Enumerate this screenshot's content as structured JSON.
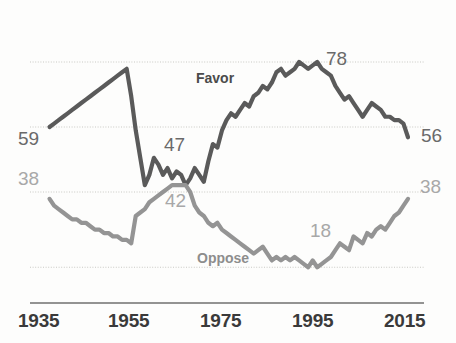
{
  "chart_data": {
    "type": "line",
    "title": "",
    "subtitle": "",
    "xlabel": "",
    "ylabel": "",
    "xlim": [
      1935,
      2015
    ],
    "ylim": [
      0,
      100
    ],
    "grid": true,
    "gridlines_y": [
      18,
      40,
      59,
      78,
      100
    ],
    "legend_position": "inline-annotation",
    "x_tick_labels": [
      "1935",
      "1955",
      "1975",
      "1995",
      "2015"
    ],
    "x_ticks": [
      1935,
      1955,
      1975,
      1995,
      2015
    ],
    "series": [
      {
        "name": "Favor",
        "color": "#5a5a5a",
        "x": [
          1936,
          1937,
          1938,
          1939,
          1940,
          1941,
          1942,
          1943,
          1944,
          1945,
          1946,
          1947,
          1948,
          1949,
          1950,
          1951,
          1952,
          1953,
          1954,
          1955,
          1956,
          1957,
          1958,
          1959,
          1960,
          1961,
          1962,
          1963,
          1964,
          1965,
          1966,
          1967,
          1968,
          1969,
          1970,
          1971,
          1972,
          1973,
          1974,
          1975,
          1976,
          1977,
          1978,
          1979,
          1980,
          1981,
          1982,
          1983,
          1984,
          1985,
          1986,
          1987,
          1988,
          1989,
          1990,
          1991,
          1992,
          1993,
          1994,
          1995,
          1996,
          1997,
          1998,
          1999,
          2000,
          2001,
          2002,
          2003,
          2004,
          2005,
          2006,
          2007,
          2008,
          2009,
          2010,
          2011,
          2012,
          2013,
          2014,
          2015
        ],
        "values": [
          59,
          60,
          61,
          62,
          63,
          64,
          65,
          66,
          67,
          68,
          69,
          70,
          71,
          72,
          73,
          74,
          75,
          76,
          68,
          58,
          50,
          42,
          45,
          50,
          48,
          45,
          47,
          44,
          46,
          45,
          42,
          44,
          47,
          45,
          43,
          49,
          54,
          53,
          58,
          61,
          63,
          62,
          64,
          66,
          65,
          68,
          69,
          71,
          70,
          72,
          75,
          76,
          74,
          75,
          76,
          78,
          77,
          76,
          77,
          78,
          76,
          75,
          74,
          71,
          69,
          67,
          68,
          66,
          64,
          62,
          64,
          66,
          65,
          64,
          62,
          62,
          61,
          61,
          60,
          56
        ]
      },
      {
        "name": "Oppose",
        "color": "#949494",
        "x": [
          1936,
          1937,
          1938,
          1939,
          1940,
          1941,
          1942,
          1943,
          1944,
          1945,
          1946,
          1947,
          1948,
          1949,
          1950,
          1951,
          1952,
          1953,
          1954,
          1955,
          1956,
          1957,
          1958,
          1959,
          1960,
          1961,
          1962,
          1963,
          1964,
          1965,
          1966,
          1967,
          1968,
          1969,
          1970,
          1971,
          1972,
          1973,
          1974,
          1975,
          1976,
          1977,
          1978,
          1979,
          1980,
          1981,
          1982,
          1983,
          1984,
          1985,
          1986,
          1987,
          1988,
          1989,
          1990,
          1991,
          1992,
          1993,
          1994,
          1995,
          1996,
          1997,
          1998,
          1999,
          2000,
          2001,
          2002,
          2003,
          2004,
          2005,
          2006,
          2007,
          2008,
          2009,
          2010,
          2011,
          2012,
          2013,
          2014,
          2015
        ],
        "values": [
          38,
          36,
          35,
          34,
          33,
          32,
          32,
          31,
          31,
          30,
          29,
          29,
          28,
          28,
          27,
          27,
          26,
          26,
          25,
          33,
          34,
          35,
          37,
          38,
          39,
          40,
          41,
          42,
          42,
          42,
          42,
          40,
          36,
          34,
          33,
          31,
          30,
          31,
          29,
          28,
          27,
          26,
          25,
          24,
          23,
          22,
          23,
          24,
          22,
          20,
          21,
          20,
          21,
          20,
          21,
          20,
          19,
          18,
          20,
          18,
          19,
          20,
          21,
          23,
          25,
          24,
          23,
          27,
          26,
          25,
          28,
          27,
          29,
          30,
          29,
          31,
          33,
          34,
          36,
          38
        ]
      }
    ],
    "point_annotations": [
      {
        "label": "59",
        "series": "Favor",
        "value": 59,
        "year": 1936,
        "tone": "dark"
      },
      {
        "label": "47",
        "series": "Favor",
        "value": 47,
        "year": 1968,
        "tone": "dark"
      },
      {
        "label": "78",
        "series": "Favor",
        "value": 78,
        "year": 1991,
        "tone": "dark"
      },
      {
        "label": "56",
        "series": "Favor",
        "value": 56,
        "year": 2015,
        "tone": "dark"
      },
      {
        "label": "38",
        "series": "Oppose",
        "value": 38,
        "year": 1936,
        "tone": "light"
      },
      {
        "label": "42",
        "series": "Oppose",
        "value": 42,
        "year": 1963,
        "tone": "light"
      },
      {
        "label": "18",
        "series": "Oppose",
        "value": 18,
        "year": 1995,
        "tone": "light"
      },
      {
        "label": "38",
        "series": "Oppose",
        "value": 38,
        "year": 2015,
        "tone": "light"
      }
    ]
  },
  "axis": {
    "ticks": [
      {
        "label": "1935"
      },
      {
        "label": "1955"
      },
      {
        "label": "1975"
      },
      {
        "label": "1995"
      },
      {
        "label": "2015"
      }
    ]
  },
  "series_labels": {
    "favor": "Favor",
    "oppose": "Oppose"
  },
  "annotations": {
    "favor_start": "59",
    "favor_cross": "47",
    "favor_peak": "78",
    "favor_end": "56",
    "oppose_start": "38",
    "oppose_cross": "42",
    "oppose_min": "18",
    "oppose_end": "38"
  },
  "colors": {
    "favor_line": "#5a5a5a",
    "oppose_line": "#949494",
    "gridline": "#c9c9c4",
    "axis_line": "#6f6f6f",
    "tick_text": "#3a3a3a",
    "label_dark": "#6a6a6a",
    "label_light": "#a8a8a8",
    "background": "#fdfdfc"
  }
}
